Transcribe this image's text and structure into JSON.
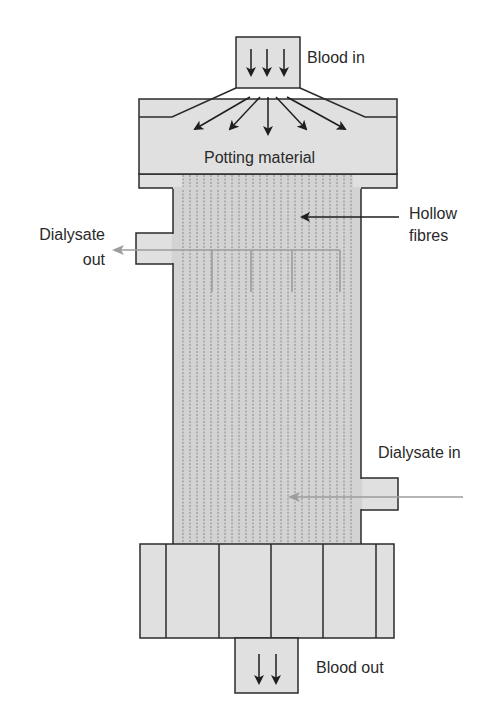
{
  "diagram": {
    "type": "hollow-fibre dialyser cross-section",
    "colors": {
      "fill": "#e0e0e0",
      "bundle_fill": "#d3d3d3",
      "outline": "#2b2b2b",
      "fibre_line": "#8a8a8a",
      "dialysate_flow": "#9c9c9c",
      "blood_arrow": "#1e1e1e"
    },
    "labels": {
      "blood_in": "Blood in",
      "potting_material": "Potting material",
      "hollow_fibres_line1": "Hollow",
      "hollow_fibres_line2": "fibres",
      "dialysate_out_line1": "Dialysate",
      "dialysate_out_line2": "out",
      "dialysate_in": "Dialysate in",
      "blood_out": "Blood out"
    },
    "nodes": [
      {
        "id": "blood-inlet",
        "label": "Blood in"
      },
      {
        "id": "top-header",
        "label": "Potting material"
      },
      {
        "id": "fibre-bundle",
        "label": "Hollow fibres"
      },
      {
        "id": "dialysate-outlet-port",
        "label": "Dialysate out"
      },
      {
        "id": "dialysate-inlet-port",
        "label": "Dialysate in"
      },
      {
        "id": "bottom-header",
        "label": ""
      },
      {
        "id": "blood-outlet",
        "label": "Blood out"
      }
    ],
    "arrows": {
      "blood_in_count": 3,
      "distribution_count": 5,
      "blood_out_count": 2
    }
  }
}
